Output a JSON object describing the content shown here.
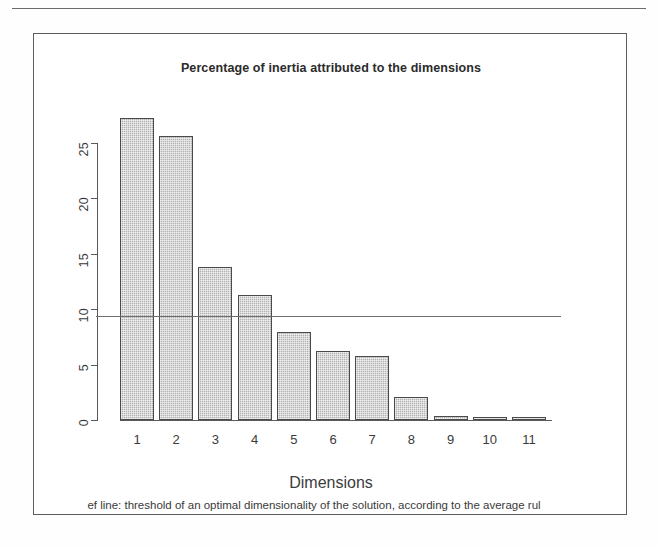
{
  "figure": {
    "title": "Percentage of inertia attributed to the dimensions",
    "caption_visible": "ef line: threshold of an optimal dimensionality of the solution, according to the average rul",
    "caption_full": "Reference line: threshold of an optimal dimensionality of the solution, according to the average rule",
    "xlabel": "Dimensions",
    "ylabel": ""
  },
  "colors": {
    "bar_fill": "#b2b2b2",
    "bar_border": "#4a4a4a",
    "axis": "#5a5a5a",
    "reference_line": "#6d6d6d",
    "frame": "#5d5d5d",
    "text": "#3a3a3a",
    "background": "#ffffff"
  },
  "chart_data": {
    "type": "bar",
    "title": "Percentage of inertia attributed to the dimensions",
    "xlabel": "Dimensions",
    "ylabel": "",
    "categories": [
      "1",
      "2",
      "3",
      "4",
      "5",
      "6",
      "7",
      "8",
      "9",
      "10",
      "11"
    ],
    "values": [
      27.3,
      25.6,
      13.8,
      11.3,
      7.9,
      6.2,
      5.8,
      2.1,
      0.4,
      0.3,
      0.3
    ],
    "ylim": [
      0,
      27.5
    ],
    "xlim": [
      0,
      11.5
    ],
    "yticks": [
      0,
      5,
      10,
      15,
      20,
      25
    ],
    "ytick_labels": [
      "0",
      "5",
      "10",
      "15",
      "20",
      "25"
    ],
    "grid": false,
    "legend": false,
    "annotations": [
      {
        "type": "hline",
        "name": "average-rule-reference-line",
        "y": 9.4,
        "label": "threshold of an optimal dimensionality of the solution, according to the average rule"
      }
    ]
  }
}
